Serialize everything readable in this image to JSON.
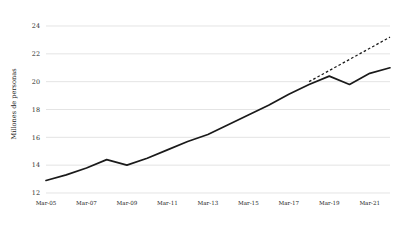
{
  "chart_data": {
    "type": "line",
    "title": "",
    "subtitle": "",
    "xlabel": "",
    "ylabel": "Millones de personas",
    "ylim": [
      12,
      24
    ],
    "xlim": [
      2005,
      2022
    ],
    "grid": true,
    "grid_axis": "y",
    "legend": false,
    "legend_position": "none",
    "ytick_labels": [
      "12",
      "14",
      "16",
      "18",
      "20",
      "22",
      "24"
    ],
    "ytick_values": [
      12,
      14,
      16,
      18,
      20,
      22,
      24
    ],
    "xtick_labels": [
      "Mar-05",
      "Mar-07",
      "Mar-09",
      "Mar-11",
      "Mar-13",
      "Mar-15",
      "Mar-17",
      "Mar-19",
      "Mar-21"
    ],
    "xtick_values": [
      2005,
      2007,
      2009,
      2011,
      2013,
      2015,
      2017,
      2019,
      2021
    ],
    "series": [
      {
        "name": "Observado",
        "style": "solid",
        "color": "#1a1a1a",
        "x": [
          2005,
          2006,
          2007,
          2008,
          2009,
          2010,
          2011,
          2012,
          2013,
          2014,
          2015,
          2016,
          2017,
          2018,
          2019,
          2020,
          2021,
          2022
        ],
        "values": [
          12.9,
          13.3,
          13.8,
          14.4,
          14.0,
          14.5,
          15.1,
          15.7,
          16.2,
          16.9,
          17.6,
          18.3,
          19.1,
          19.8,
          20.4,
          19.8,
          20.6,
          21.0
        ]
      },
      {
        "name": "Tendencia",
        "style": "dashed",
        "color": "#1a1a1a",
        "x": [
          2018,
          2019,
          2020,
          2021,
          2022
        ],
        "values": [
          20.0,
          20.8,
          21.6,
          22.4,
          23.2
        ]
      }
    ],
    "annotations": []
  },
  "colors": {
    "background": "#ffffff",
    "line": "#1a1a1a",
    "gridline": "#d8d8d8",
    "text": "#2b2b2b"
  }
}
